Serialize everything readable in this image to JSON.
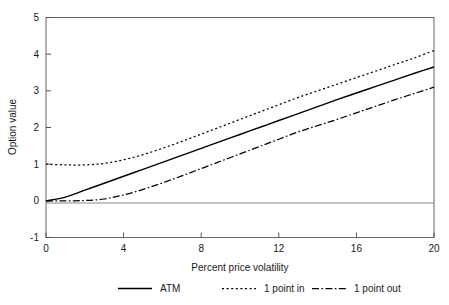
{
  "chart_data": {
    "type": "line",
    "title": "",
    "xlabel": "Percent price volatility",
    "ylabel": "Option value",
    "xlim": [
      0,
      20
    ],
    "ylim": [
      -1,
      5
    ],
    "xticks": [
      0,
      4,
      8,
      12,
      16,
      20
    ],
    "yticks": [
      -1,
      0,
      1,
      2,
      3,
      4,
      5
    ],
    "xtick_labels": [
      "0",
      "4",
      "8",
      "12",
      "16",
      "20"
    ],
    "ytick_labels": [
      "-1",
      "0",
      "1",
      "2",
      "3",
      "4",
      "5"
    ],
    "grid": false,
    "zero_line": true,
    "legend_position": "below",
    "x": [
      0,
      1,
      2,
      3,
      4,
      5,
      6,
      7,
      8,
      9,
      10,
      11,
      12,
      13,
      14,
      15,
      16,
      17,
      18,
      19,
      20
    ],
    "series": [
      {
        "name": "ATM",
        "style": "solid",
        "color": "#000000",
        "values": [
          0.0,
          0.1,
          0.29,
          0.48,
          0.67,
          0.86,
          1.05,
          1.24,
          1.43,
          1.62,
          1.81,
          2.0,
          2.19,
          2.38,
          2.57,
          2.76,
          2.94,
          3.12,
          3.3,
          3.48,
          3.65
        ]
      },
      {
        "name": "1 point in",
        "style": "dotted",
        "color": "#000000",
        "values": [
          1.0,
          0.98,
          0.98,
          1.02,
          1.12,
          1.26,
          1.43,
          1.62,
          1.82,
          2.02,
          2.22,
          2.42,
          2.62,
          2.82,
          3.0,
          3.18,
          3.36,
          3.54,
          3.72,
          3.9,
          4.1
        ]
      },
      {
        "name": "1 point out",
        "style": "dashdot",
        "color": "#000000",
        "values": [
          0.0,
          0.0,
          0.01,
          0.05,
          0.16,
          0.31,
          0.49,
          0.68,
          0.88,
          1.08,
          1.28,
          1.48,
          1.68,
          1.88,
          2.05,
          2.22,
          2.4,
          2.58,
          2.76,
          2.93,
          3.1
        ]
      }
    ]
  },
  "axes": {
    "ylabel": "Option value",
    "xlabel": "Percent price volatility",
    "ytick_labels": [
      "5",
      "4",
      "3",
      "2",
      "1",
      "0",
      "-1"
    ],
    "xtick_labels": [
      "0",
      "4",
      "8",
      "12",
      "16",
      "20"
    ]
  },
  "legend": {
    "items": [
      {
        "label": "ATM",
        "style": "solid"
      },
      {
        "label": "1 point in",
        "style": "dotted"
      },
      {
        "label": "1 point out",
        "style": "dashdot"
      }
    ]
  }
}
